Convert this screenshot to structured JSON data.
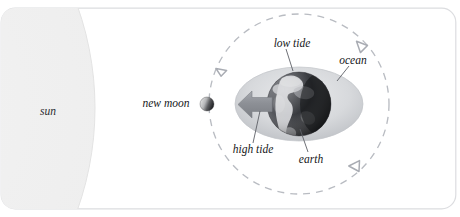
{
  "figure": {
    "title_text": "",
    "background_color": "#ffffff",
    "border_color": "#dcdde0"
  },
  "labels": {
    "sun": "sun",
    "new_moon": "new moon",
    "low_tide": "low tide",
    "ocean": "ocean",
    "high_tide": "high tide",
    "earth": "earth"
  },
  "bodies": {
    "sun": {
      "name": "sun",
      "fill_color": "#ededed",
      "edge_color": "#e2e2e2",
      "center_x": -210,
      "center_y": 108,
      "radius": 305
    },
    "moon": {
      "name": "new moon",
      "lit_side_color": "#dadada",
      "dark_side_color": "#1f2024",
      "center_x": 207,
      "center_y": 104,
      "radius": 7
    },
    "earth": {
      "name": "earth",
      "ocean_color": "#cfd1d4",
      "land_color": "#d9dadd",
      "dark_color": "#232428",
      "center_x": 299,
      "center_y": 104,
      "radius": 32
    },
    "ocean_bulge": {
      "name": "ocean",
      "fill_color": "#d5d7da",
      "center_x": 299,
      "center_y": 104,
      "radius_x": 64,
      "radius_y": 37
    }
  },
  "orbit": {
    "name": "moon-orbit",
    "style": "dashed",
    "color": "#b9bcc2",
    "center_x": 299,
    "center_y": 104,
    "radius": 90,
    "direction": "counterclockwise"
  },
  "tide_arrow": {
    "name": "high-tide-arrow",
    "direction": "left",
    "color": "#8e9197"
  }
}
